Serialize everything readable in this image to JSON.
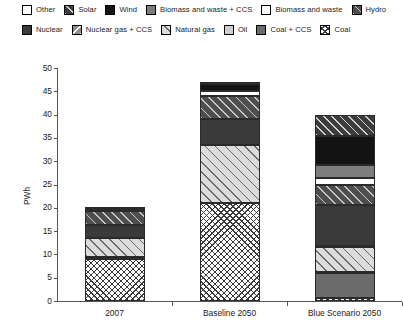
{
  "legend": {
    "rows": [
      [
        {
          "label": "Other",
          "pattern": "empty"
        },
        {
          "label": "Solar",
          "pattern": "diag-dark"
        },
        {
          "label": "Wind",
          "pattern": "solid-black"
        },
        {
          "label": "Biomass and waste + CCS",
          "pattern": "solid-midgrey"
        },
        {
          "label": "Biomass and waste",
          "pattern": "empty"
        },
        {
          "label": "Hydro",
          "pattern": "diag-darkgrey"
        }
      ],
      [
        {
          "label": "Nuclear",
          "pattern": "solid-darkgrey"
        },
        {
          "label": "Nuclear gas + CCS",
          "pattern": "backdiag-grey"
        },
        {
          "label": "Natural gas",
          "pattern": "diag-light"
        },
        {
          "label": "Oil",
          "pattern": "solid-lightgrey"
        },
        {
          "label": "Coal + CCS",
          "pattern": "solid-grey"
        },
        {
          "label": "Coal",
          "pattern": "crosshatch"
        }
      ]
    ]
  },
  "chart_data": {
    "type": "bar",
    "subtype": "stacked",
    "title": "",
    "xlabel": "",
    "ylabel": "PWh",
    "ylim": [
      0,
      50
    ],
    "ytick_step": 5,
    "yticks": [
      0,
      5,
      10,
      15,
      20,
      25,
      30,
      35,
      40,
      45,
      50
    ],
    "grid": false,
    "legend_position": "top",
    "categories": [
      "2007",
      "Baseline 2050",
      "Blue Scenario 2050"
    ],
    "series": [
      {
        "name": "Coal",
        "pattern": "crosshatch",
        "values": [
          9.0,
          21.0,
          0.6
        ]
      },
      {
        "name": "Coal + CCS",
        "pattern": "solid-grey",
        "values": [
          0.0,
          0.0,
          5.4
        ]
      },
      {
        "name": "Oil",
        "pattern": "solid-lightgrey",
        "values": [
          0.4,
          0.0,
          0.3
        ]
      },
      {
        "name": "Natural gas",
        "pattern": "diag-light",
        "values": [
          4.2,
          12.5,
          5.2
        ]
      },
      {
        "name": "Nuclear gas + CCS",
        "pattern": "backdiag-grey",
        "values": [
          0.0,
          0.0,
          0.4
        ]
      },
      {
        "name": "Nuclear",
        "pattern": "solid-darkgrey",
        "values": [
          2.7,
          5.5,
          8.8
        ]
      },
      {
        "name": "Hydro",
        "pattern": "diag-darkgrey",
        "values": [
          3.1,
          5.0,
          4.2
        ]
      },
      {
        "name": "Biomass and waste",
        "pattern": "empty",
        "values": [
          0.4,
          1.1,
          1.6
        ]
      },
      {
        "name": "Biomass and waste + CCS",
        "pattern": "solid-midgrey",
        "values": [
          0.0,
          0.0,
          2.7
        ]
      },
      {
        "name": "Wind",
        "pattern": "solid-black",
        "values": [
          0.2,
          1.5,
          6.2
        ]
      },
      {
        "name": "Solar",
        "pattern": "diag-dark",
        "values": [
          0.0,
          0.4,
          4.6
        ]
      },
      {
        "name": "Other",
        "pattern": "empty",
        "values": [
          0.0,
          0.0,
          0.0
        ]
      }
    ],
    "totals": [
      20.0,
      47.0,
      40.0
    ]
  }
}
